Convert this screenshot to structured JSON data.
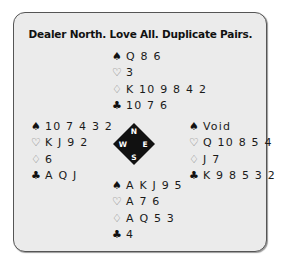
{
  "title": "Dealer North. Love All. Duplicate Pairs.",
  "compass": {
    "n": "N",
    "e": "E",
    "s": "S",
    "w": "W"
  },
  "hands": {
    "north": {
      "spades": "Q 8 6",
      "hearts": "3",
      "diamonds": "K 10 9 8 4 2",
      "clubs": "10 7 6"
    },
    "west": {
      "spades": "10 7 4 3 2",
      "hearts": "K J 9 2",
      "diamonds": "6",
      "clubs": "A Q J"
    },
    "east": {
      "spades": "Void",
      "hearts": "Q 10 8 5 4",
      "diamonds": "J 7",
      "clubs": "K 9 8 5 3 2"
    },
    "south": {
      "spades": "A K J 9 5",
      "hearts": "A 7 6",
      "diamonds": "A Q 5 3",
      "clubs": "4"
    }
  },
  "suits": {
    "spades": "♠",
    "hearts": "♡",
    "diamonds": "♢",
    "clubs": "♣"
  }
}
